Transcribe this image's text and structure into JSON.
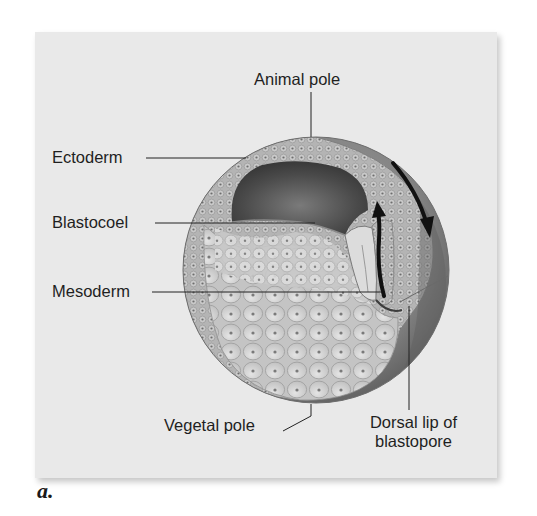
{
  "figure": {
    "panel_letter": "a.",
    "colors": {
      "panel_background": "#e9e9e9",
      "label_text": "#1f1f1f",
      "arrow": "#111111",
      "outer_surface": "#8a8a8a",
      "ectoderm_layer": "#a9a9a9",
      "blastocoel_cavity": "#4f4f4f",
      "yolk_cells": "#d6d6d6"
    },
    "labels": {
      "animal_pole": "Animal pole",
      "ectoderm": "Ectoderm",
      "blastocoel": "Blastocoel",
      "mesoderm": "Mesoderm",
      "vegetal_pole": "Vegetal pole",
      "dorsal_lip_line1": "Dorsal lip of",
      "dorsal_lip_line2": "blastopore"
    },
    "arrows": [
      {
        "name": "involution-down-arrow",
        "direction": "downward along outer surface toward dorsal lip"
      },
      {
        "name": "involution-up-arrow",
        "direction": "upward along inner wall from dorsal lip"
      }
    ]
  }
}
